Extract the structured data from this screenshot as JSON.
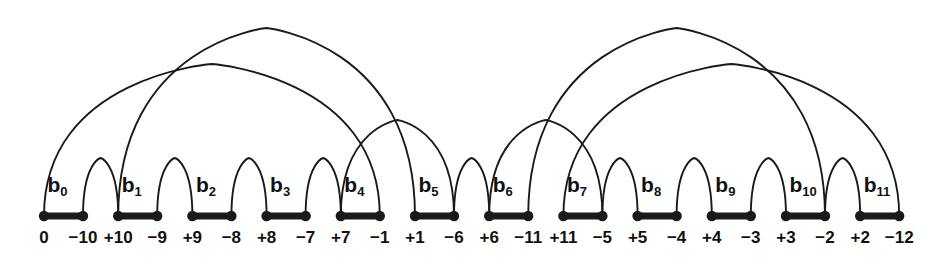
{
  "figure": {
    "type": "arc-diagram",
    "width": 938,
    "height": 264,
    "baseline_y": 216,
    "stroke_color": "#1a1a1a",
    "node_count": 12,
    "block_width": 39,
    "block_pitch": 74.2,
    "first_left_x": 44
  },
  "nodes": [
    {
      "name": "b",
      "sub": "0",
      "left_label": "0",
      "right_label": "−10"
    },
    {
      "name": "b",
      "sub": "1",
      "left_label": "+10",
      "right_label": "−9"
    },
    {
      "name": "b",
      "sub": "2",
      "left_label": "+9",
      "right_label": "−8"
    },
    {
      "name": "b",
      "sub": "3",
      "left_label": "+8",
      "right_label": "−7"
    },
    {
      "name": "b",
      "sub": "4",
      "left_label": "+7",
      "right_label": "−1"
    },
    {
      "name": "b",
      "sub": "5",
      "left_label": "+1",
      "right_label": "−6"
    },
    {
      "name": "b",
      "sub": "6",
      "left_label": "+6",
      "right_label": "−11"
    },
    {
      "name": "b",
      "sub": "7",
      "left_label": "+11",
      "right_label": "−5"
    },
    {
      "name": "b",
      "sub": "8",
      "left_label": "+5",
      "right_label": "−4"
    },
    {
      "name": "b",
      "sub": "9",
      "left_label": "+4",
      "right_label": "−3"
    },
    {
      "name": "b",
      "sub": "10",
      "left_label": "+3",
      "right_label": "−2"
    },
    {
      "name": "b",
      "sub": "11",
      "left_label": "+2",
      "right_label": "−12"
    }
  ],
  "arcs": [
    {
      "id": "small-0-1",
      "from": {
        "node": 0,
        "side": "right"
      },
      "to": {
        "node": 1,
        "side": "left"
      },
      "height": 58
    },
    {
      "id": "small-1-2",
      "from": {
        "node": 1,
        "side": "right"
      },
      "to": {
        "node": 2,
        "side": "left"
      },
      "height": 58
    },
    {
      "id": "small-2-3",
      "from": {
        "node": 2,
        "side": "right"
      },
      "to": {
        "node": 3,
        "side": "left"
      },
      "height": 58
    },
    {
      "id": "small-3-4",
      "from": {
        "node": 3,
        "side": "right"
      },
      "to": {
        "node": 4,
        "side": "left"
      },
      "height": 58
    },
    {
      "id": "small-5-6",
      "from": {
        "node": 5,
        "side": "right"
      },
      "to": {
        "node": 6,
        "side": "left"
      },
      "height": 58
    },
    {
      "id": "small-7-8",
      "from": {
        "node": 7,
        "side": "right"
      },
      "to": {
        "node": 8,
        "side": "left"
      },
      "height": 58
    },
    {
      "id": "small-8-9",
      "from": {
        "node": 8,
        "side": "right"
      },
      "to": {
        "node": 9,
        "side": "left"
      },
      "height": 58
    },
    {
      "id": "small-9-10",
      "from": {
        "node": 9,
        "side": "right"
      },
      "to": {
        "node": 10,
        "side": "left"
      },
      "height": 58
    },
    {
      "id": "small-10-11",
      "from": {
        "node": 10,
        "side": "right"
      },
      "to": {
        "node": 11,
        "side": "left"
      },
      "height": 58
    },
    {
      "id": "mid-4-6",
      "from": {
        "node": 4,
        "side": "left"
      },
      "to": {
        "node": 5,
        "side": "right"
      },
      "height": 96
    },
    {
      "id": "mid-6-7",
      "from": {
        "node": 6,
        "side": "left"
      },
      "to": {
        "node": 7,
        "side": "right"
      },
      "height": 96
    },
    {
      "id": "big-0-4",
      "from": {
        "node": 0,
        "side": "left"
      },
      "to": {
        "node": 4,
        "side": "right"
      },
      "height": 152
    },
    {
      "id": "big-1-5",
      "from": {
        "node": 1,
        "side": "left"
      },
      "to": {
        "node": 5,
        "side": "left"
      },
      "height": 188
    },
    {
      "id": "big-6-10",
      "from": {
        "node": 6,
        "side": "right"
      },
      "to": {
        "node": 10,
        "side": "right"
      },
      "height": 188
    },
    {
      "id": "big-7-11",
      "from": {
        "node": 7,
        "side": "left"
      },
      "to": {
        "node": 11,
        "side": "right"
      },
      "height": 152
    }
  ]
}
